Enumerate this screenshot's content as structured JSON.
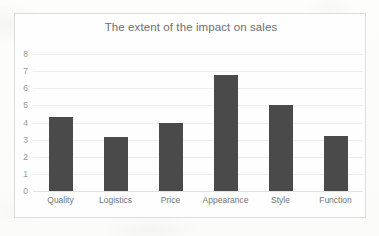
{
  "chart_data": {
    "type": "bar",
    "title": "The extent of the impact on sales",
    "xlabel": "",
    "ylabel": "",
    "categories": [
      "Quality",
      "Logistics",
      "Price",
      "Appearance",
      "Style",
      "Function"
    ],
    "values": [
      4.3,
      3.15,
      4.0,
      6.75,
      5.05,
      3.2
    ],
    "ylim": [
      0,
      8
    ],
    "yticks": [
      0,
      1,
      2,
      3,
      4,
      5,
      6,
      7,
      8
    ],
    "ytick_labels": [
      "0",
      "1",
      "2",
      "3",
      "4",
      "5",
      "6",
      "7",
      "8"
    ],
    "grid": true,
    "legend": false,
    "legend_position": "none",
    "bar_color": "#4a4a4a",
    "gridline_color": "#ededed",
    "axis_label_color": "#9a9a9a",
    "title_color": "#6f6f6f",
    "frame_color": "#dcdcdc",
    "plot_background": "#fefefe"
  }
}
